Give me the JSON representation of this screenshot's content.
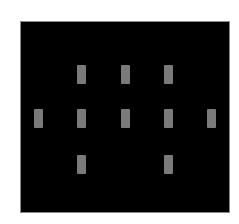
{
  "figure": {
    "background": "#ffffff",
    "board": {
      "color": "#000000",
      "x": 20,
      "y": 21,
      "width": 210,
      "height": 192
    },
    "marker": {
      "color": "#7a7a7a",
      "width": 9,
      "height": 19,
      "shape": "rectangle"
    },
    "grid": {
      "columns_x": [
        34,
        77,
        121,
        164,
        207
      ],
      "rows_y": [
        65,
        109,
        155
      ]
    },
    "markers": [
      {
        "row": 0,
        "col": 1
      },
      {
        "row": 0,
        "col": 2
      },
      {
        "row": 0,
        "col": 3
      },
      {
        "row": 1,
        "col": 0
      },
      {
        "row": 1,
        "col": 1
      },
      {
        "row": 1,
        "col": 2
      },
      {
        "row": 1,
        "col": 3
      },
      {
        "row": 1,
        "col": 4
      },
      {
        "row": 2,
        "col": 1
      },
      {
        "row": 2,
        "col": 3
      }
    ]
  }
}
